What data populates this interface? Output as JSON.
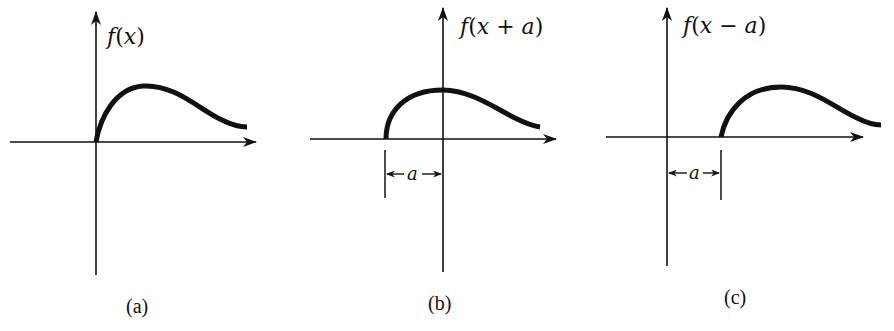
{
  "figure": {
    "panels": [
      {
        "id": "a",
        "function_label": "f(x)",
        "caption": "(a)",
        "shift_label": null
      },
      {
        "id": "b",
        "function_label": "f(x + a)",
        "caption": "(b)",
        "shift_label": "a"
      },
      {
        "id": "c",
        "function_label": "f(x − a)",
        "caption": "(c)",
        "shift_label": "a"
      }
    ],
    "colors": {
      "ink": "#111111",
      "background": "#ffffff"
    }
  }
}
